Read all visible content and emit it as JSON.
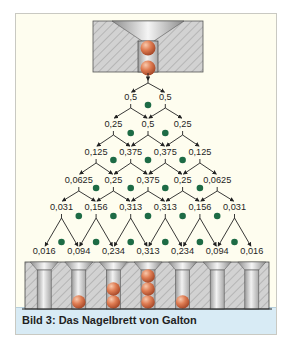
{
  "caption": "Bild 3: Das Nagelbrett von Galton",
  "colors": {
    "background": "#fefdef",
    "pin": "#1d6b45",
    "ball": "#d9764f",
    "caption_band": "#d8ebf5",
    "hatch_block": "#cfcfcf"
  },
  "rows": [
    [
      "0,5",
      "0,5"
    ],
    [
      "0,25",
      "0,5",
      "0,25"
    ],
    [
      "0,125",
      "0,375",
      "0,375",
      "0,125"
    ],
    [
      "0,0625",
      "0,25",
      "0,375",
      "0,25",
      "0,0625"
    ],
    [
      "0,031",
      "0,156",
      "0,313",
      "0,313",
      "0,156",
      "0,031"
    ],
    [
      "0,016",
      "0,094",
      "0,234",
      "0,313",
      "0,234",
      "0,094",
      "0,016"
    ]
  ],
  "bins": {
    "count": 7,
    "balls_per_bin": [
      0,
      1,
      2,
      3,
      1,
      0,
      0
    ]
  },
  "funnel": {
    "balls": 2
  }
}
